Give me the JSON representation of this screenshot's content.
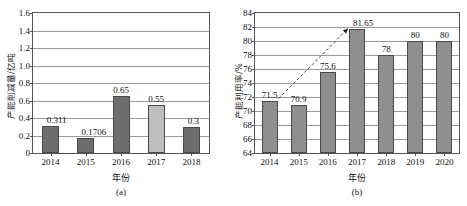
{
  "figure": {
    "panels": [
      {
        "caption": "(a)",
        "xlabel": "年份",
        "ylabel": "产能削减量/亿吨"
      },
      {
        "caption": "(b)",
        "xlabel": "年份",
        "ylabel": "产能利用率/%"
      }
    ]
  },
  "chart_data": [
    {
      "type": "bar",
      "title": "",
      "panel": "(a)",
      "xlabel": "年份",
      "ylabel": "产能削减量/亿吨",
      "categories": [
        "2014",
        "2015",
        "2016",
        "2017",
        "2018"
      ],
      "values": [
        0.311,
        0.1706,
        0.65,
        0.55,
        0.3
      ],
      "data_labels": [
        "0.311",
        "0.1706",
        "0.65",
        "0.55",
        "0.3"
      ],
      "bar_shades": [
        "dark",
        "dark",
        "dark",
        "light",
        "dark"
      ],
      "ylim": [
        0,
        1.6
      ],
      "ytick_step": 0.2,
      "ytick_labels": [
        "0",
        "0.2",
        "0.4",
        "0.6",
        "0.8",
        "1.0",
        "1.2",
        "1.4",
        "1.6"
      ],
      "grid": true,
      "legend": "none",
      "colors": {
        "bar_dark": "#6e6e6e",
        "bar_light": "#bdbdbd",
        "axis": "#555555",
        "grid": "#9a9a9a"
      }
    },
    {
      "type": "bar",
      "title": "",
      "panel": "(b)",
      "xlabel": "年份",
      "ylabel": "产能利用率/%",
      "categories": [
        "2014",
        "2015",
        "2016",
        "2017",
        "2018",
        "2019",
        "2020"
      ],
      "values": [
        71.5,
        70.9,
        75.6,
        81.65,
        78,
        80,
        80
      ],
      "data_labels": [
        "71.5",
        "70.9",
        "75.6",
        "81.65",
        "78",
        "80",
        "80"
      ],
      "bar_shades": [
        "mid",
        "mid",
        "mid",
        "mid",
        "mid",
        "mid",
        "mid"
      ],
      "ylim": [
        64,
        84
      ],
      "ytick_step": 2,
      "ytick_labels": [
        "64",
        "66",
        "68",
        "70",
        "72",
        "74",
        "76",
        "78",
        "80",
        "82",
        "84"
      ],
      "grid": true,
      "legend": "none",
      "annotations": [
        {
          "type": "dashed-arrow",
          "from_category": "2014",
          "from_value": 71.5,
          "to_category": "2017",
          "to_value": 81.65
        }
      ],
      "colors": {
        "bar_mid": "#8f8f8f",
        "axis": "#555555",
        "grid": "#9a9a9a"
      }
    }
  ]
}
